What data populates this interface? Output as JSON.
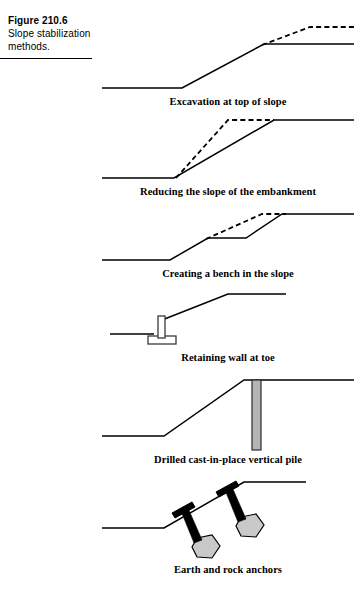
{
  "figure": {
    "number": "Figure 210.6",
    "title": "Slope stabilization methods."
  },
  "panels": [
    {
      "id": "excavation-at-top-of-slope",
      "caption": "Excavation at top of slope",
      "description": "Slope profile with dashed original crest removed by excavation at the top of the slope",
      "elements": {
        "ground_profile": "M 6,72 L 86,72 L 168,28 L 258,28",
        "original_profile": "M 166,29 L 214,11 L 258,11"
      }
    },
    {
      "id": "reducing-the-slope-of-the-embankment",
      "caption": "Reducing the slope of the embankment",
      "description": "Steep dashed original embankment slope replaced by a flatter solid slope from the same toe",
      "elements": {
        "ground_profile": "M 6,70 L 78,70 L 178,12 L 258,12",
        "original_profile": "M 80,70 L 132,12 L 178,12"
      }
    },
    {
      "id": "creating-a-bench-in-the-slope",
      "caption": "Creating a bench in the slope",
      "description": "Slope cut with a horizontal bench partway up; dashed line shows original continuous slope",
      "elements": {
        "ground_profile": "M 6,56 L 74,56 L 112,34 L 150,34 L 186,10 L 258,10",
        "original_profile": "M 110,35 L 166,10 L 190,10"
      }
    },
    {
      "id": "retaining-wall-at-toe",
      "caption": "Retaining wall at toe",
      "description": "T-shaped cantilever retaining wall with footing placed at the toe of the slope",
      "elements": {
        "ground_profile": "M 14,48 L 58,48",
        "slope_profile": "M 66,34 L 132,8 L 190,8",
        "wall_stem": {
          "x": 62,
          "y": 30,
          "width": 7,
          "height": 24
        },
        "wall_footing": {
          "x": 52,
          "y": 50,
          "width": 28,
          "height": 8
        }
      }
    },
    {
      "id": "drilled-cast-in-place-vertical-pile",
      "caption": "Drilled cast-in-place vertical pile",
      "description": "Gray drilled cast-in-place vertical pile installed at the crest of the slope",
      "elements": {
        "ground_profile": "M 6,64 L 68,64 L 148,8 L 258,8",
        "pile": {
          "x": 156,
          "y": 8,
          "width": 9,
          "height": 70
        }
      }
    },
    {
      "id": "earth-and-rock-anchors",
      "caption": "Earth and rock anchors",
      "description": "Two earth and rock anchors with black bearing plates, tendons and gray grouted bulbs",
      "elements": {
        "ground_profile": "M 6,56 L 68,56 L 148,10 L 210,10",
        "anchors": [
          {
            "plate": "M 76,41 L 96,30 L 99,35 L 79,46 Z",
            "tendon": "M 85,39 L 92,36 L 106,68 L 98,71 Z",
            "bulb": "M 101,66 L 116,63 L 124,74 L 116,86 L 101,85 L 96,75 Z"
          },
          {
            "plate": "M 120,20 L 140,9 L 143,14 L 123,25 Z",
            "tendon": "M 129,18 L 136,15 L 150,47 L 142,50 Z",
            "bulb": "M 145,45 L 160,42 L 168,53 L 160,65 L 145,64 L 140,54 Z"
          }
        ]
      }
    }
  ]
}
